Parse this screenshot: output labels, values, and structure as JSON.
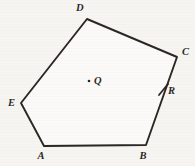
{
  "figure": {
    "canvas": {
      "width": 195,
      "height": 166
    },
    "background_color": "#f6f5f2",
    "stroke_color": "#2a2724",
    "fill_color": "#fbfaf8",
    "shape": {
      "name": "pentagon",
      "vertex_order": [
        "A",
        "B",
        "C",
        "D",
        "E"
      ],
      "path": "44,146 146,145 177,57 87,19 21,103"
    },
    "vertices": [
      {
        "id": "A",
        "label": "A",
        "x": 44,
        "y": 146,
        "label_x": 41,
        "label_y": 159
      },
      {
        "id": "B",
        "label": "B",
        "x": 146,
        "y": 145,
        "label_x": 143,
        "label_y": 159
      },
      {
        "id": "C",
        "label": "C",
        "x": 177,
        "y": 57,
        "label_x": 182,
        "label_y": 55
      },
      {
        "id": "D",
        "label": "D",
        "x": 87,
        "y": 19,
        "label_x": 80,
        "label_y": 11
      },
      {
        "id": "E",
        "label": "E",
        "x": 21,
        "y": 103,
        "label_x": 8,
        "label_y": 106
      }
    ],
    "points": [
      {
        "id": "Q",
        "label": "Q",
        "kind": "interior-point",
        "x": 89,
        "y": 81,
        "dot_radius": 1.3,
        "label_x": 94,
        "label_y": 84
      },
      {
        "id": "R",
        "label": "R",
        "kind": "point-on-side",
        "on_side": "BC",
        "x": 163,
        "y": 90,
        "label_x": 168,
        "label_y": 94,
        "tick": {
          "x1": 159,
          "y1": 95,
          "x2": 168,
          "y2": 84
        }
      }
    ],
    "edges": [
      {
        "id": "AB",
        "from": "A",
        "to": "B"
      },
      {
        "id": "BC",
        "from": "B",
        "to": "C"
      },
      {
        "id": "CD",
        "from": "C",
        "to": "D"
      },
      {
        "id": "DE",
        "from": "D",
        "to": "E"
      },
      {
        "id": "EA",
        "from": "E",
        "to": "A"
      }
    ]
  }
}
